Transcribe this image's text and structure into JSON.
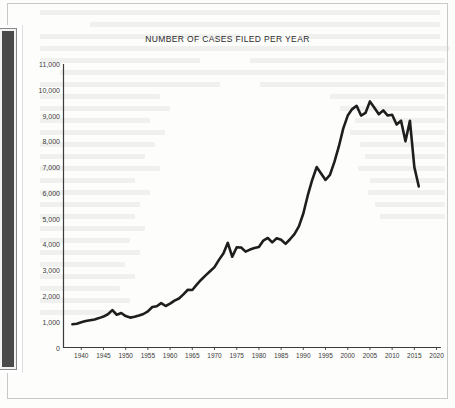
{
  "page": {
    "background_color": "#fdfdfc",
    "frame_color": "#c9c9c7",
    "binding_color": "#4a4a4a"
  },
  "chart_data": {
    "type": "line",
    "title": "NUMBER OF CASES FILED PER YEAR",
    "xlabel": "",
    "ylabel": "",
    "xlim": [
      1936,
      2021
    ],
    "ylim": [
      0,
      11000
    ],
    "grid": false,
    "legend": null,
    "line_color": "#1e1e1e",
    "line_width": 2.6,
    "y_ticks": [
      0,
      1000,
      2000,
      3000,
      4000,
      5000,
      6000,
      7000,
      8000,
      9000,
      10000,
      11000
    ],
    "y_tick_labels": [
      "0",
      "1,000",
      "2,000",
      "3,000",
      "4,000",
      "5,000",
      "6,000",
      "7,000",
      "8,000",
      "9,000",
      "10,000",
      "11,000"
    ],
    "x_ticks": [
      1940,
      1945,
      1950,
      1955,
      1960,
      1965,
      1970,
      1975,
      1980,
      1985,
      1990,
      1995,
      2000,
      2005,
      2010,
      2015,
      2020
    ],
    "x_tick_labels": [
      "1940",
      "1945",
      "1950",
      "1955",
      "1960",
      "1965",
      "1970",
      "1975",
      "1980",
      "1985",
      "1990",
      "1995",
      "2000",
      "2005",
      "2010",
      "2015",
      "2020"
    ],
    "x": [
      1938,
      1939,
      1940,
      1941,
      1942,
      1943,
      1944,
      1945,
      1946,
      1947,
      1948,
      1949,
      1950,
      1951,
      1952,
      1953,
      1954,
      1955,
      1956,
      1957,
      1958,
      1959,
      1960,
      1961,
      1962,
      1963,
      1964,
      1965,
      1966,
      1967,
      1968,
      1969,
      1970,
      1971,
      1972,
      1973,
      1974,
      1975,
      1976,
      1977,
      1978,
      1979,
      1980,
      1981,
      1982,
      1983,
      1984,
      1985,
      1986,
      1987,
      1988,
      1989,
      1990,
      1991,
      1992,
      1993,
      1994,
      1995,
      1996,
      1997,
      1998,
      1999,
      2000,
      2001,
      2002,
      2003,
      2004,
      2005,
      2006,
      2007,
      2008,
      2009,
      2010,
      2011,
      2012,
      2013,
      2014,
      2015,
      2016
    ],
    "y": [
      900,
      920,
      980,
      1030,
      1060,
      1090,
      1140,
      1200,
      1290,
      1450,
      1270,
      1340,
      1220,
      1160,
      1190,
      1240,
      1300,
      1400,
      1570,
      1600,
      1720,
      1610,
      1700,
      1820,
      1900,
      2060,
      2240,
      2230,
      2440,
      2630,
      2800,
      2960,
      3120,
      3400,
      3650,
      4060,
      3520,
      3890,
      3880,
      3720,
      3800,
      3860,
      3900,
      4150,
      4250,
      4080,
      4240,
      4180,
      4020,
      4200,
      4400,
      4700,
      5200,
      5900,
      6500,
      7000,
      6750,
      6500,
      6700,
      7200,
      7800,
      8500,
      9000,
      9250,
      9380,
      9000,
      9100,
      9550,
      9300,
      9050,
      9200,
      9000,
      9030,
      8650,
      8800,
      8000,
      8800,
      7000,
      6250
    ],
    "series": [
      {
        "name": "Cases filed per year",
        "values": [
          900,
          920,
          980,
          1030,
          1060,
          1090,
          1140,
          1200,
          1290,
          1450,
          1270,
          1340,
          1220,
          1160,
          1190,
          1240,
          1300,
          1400,
          1570,
          1600,
          1720,
          1610,
          1700,
          1820,
          1900,
          2060,
          2240,
          2230,
          2440,
          2630,
          2800,
          2960,
          3120,
          3400,
          3650,
          4060,
          3520,
          3890,
          3880,
          3720,
          3800,
          3860,
          3900,
          4150,
          4250,
          4080,
          4240,
          4180,
          4020,
          4200,
          4400,
          4700,
          5200,
          5900,
          6500,
          7000,
          6750,
          6500,
          6700,
          7200,
          7800,
          8500,
          9000,
          9250,
          9380,
          9000,
          9100,
          9550,
          9300,
          9050,
          9200,
          9000,
          9030,
          8650,
          8800,
          8000,
          8800,
          7000,
          6250
        ]
      }
    ],
    "annotations": []
  }
}
